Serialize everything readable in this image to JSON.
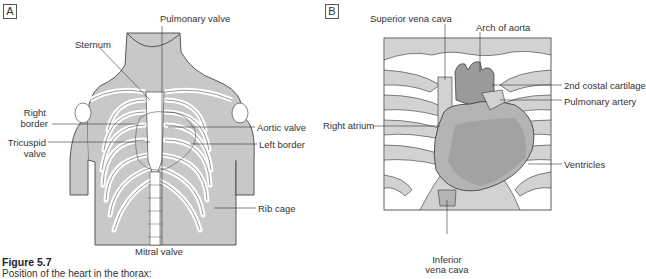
{
  "figure": {
    "number": "Figure 5.7",
    "caption": "Position of the heart in the thorax:"
  },
  "colors": {
    "skin_gray": "#c8c8c8",
    "rib_white": "#ffffff",
    "heart_dark": "#9a9a9a",
    "heart_mid": "#b4b4b4",
    "outline": "#333333",
    "rib_band_gray": "#d2d2d2"
  },
  "panel_a": {
    "tag": "A",
    "labels": {
      "pulmonary_valve": "Pulmonary valve",
      "sternum": "Sternum",
      "right_border_1": "Right",
      "right_border_2": "border",
      "aortic_valve": "Aortic valve",
      "tricuspid_1": "Tricuspid",
      "tricuspid_2": "valve",
      "left_border": "Left border",
      "rib_cage": "Rib cage",
      "mitral_valve": "Mitral valve"
    }
  },
  "panel_b": {
    "tag": "B",
    "labels": {
      "superior_vena_cava": "Superior vena cava",
      "arch_of_aorta": "Arch of aorta",
      "second_costal_cartilage": "2nd costal cartilage",
      "pulmonary_artery": "Pulmonary artery",
      "right_atrium": "Right atrium",
      "ventricles": "Ventricles",
      "inferior_vena_cava_1": "Inferior",
      "inferior_vena_cava_2": "vena cava"
    }
  }
}
